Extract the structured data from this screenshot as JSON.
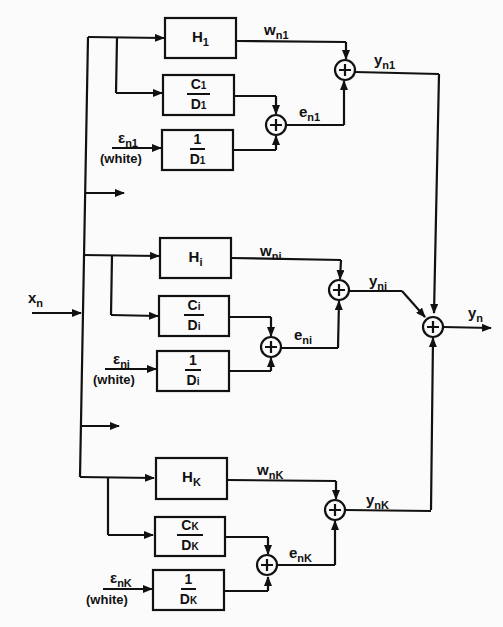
{
  "figure": {
    "type": "block-diagram",
    "input": {
      "symbol": "x",
      "subscript": "n"
    },
    "output": {
      "symbol": "y",
      "subscript": "n"
    },
    "colors": {
      "ink": "#111111",
      "background": "#fbfbfb"
    },
    "branches": [
      {
        "id": "1",
        "H": {
          "symbol": "H",
          "subscript": "1"
        },
        "CD": {
          "num": "C",
          "num_sub": "1",
          "den": "D",
          "den_sub": "1"
        },
        "invD": {
          "num": "1",
          "den": "D",
          "den_sub": "1"
        },
        "noise": {
          "symbol": "ε",
          "subscript": "n1",
          "note": "(white)"
        },
        "w": {
          "symbol": "w",
          "subscript": "n1"
        },
        "e": {
          "symbol": "e",
          "subscript": "n1"
        },
        "y": {
          "symbol": "y",
          "subscript": "n1"
        }
      },
      {
        "id": "i",
        "H": {
          "symbol": "H",
          "subscript": "i"
        },
        "CD": {
          "num": "C",
          "num_sub": "i",
          "den": "D",
          "den_sub": "i"
        },
        "invD": {
          "num": "1",
          "den": "D",
          "den_sub": "i"
        },
        "noise": {
          "symbol": "ε",
          "subscript": "ni",
          "note": "(white)"
        },
        "w": {
          "symbol": "w",
          "subscript": "ni"
        },
        "e": {
          "symbol": "e",
          "subscript": "ni"
        },
        "y": {
          "symbol": "y",
          "subscript": "ni"
        }
      },
      {
        "id": "K",
        "H": {
          "symbol": "H",
          "subscript": "K"
        },
        "CD": {
          "num": "C",
          "num_sub": "K",
          "den": "D",
          "den_sub": "K"
        },
        "invD": {
          "num": "1",
          "den": "D",
          "den_sub": "K"
        },
        "noise": {
          "symbol": "ε",
          "subscript": "nK",
          "note": "(white)"
        },
        "w": {
          "symbol": "w",
          "subscript": "nK"
        },
        "e": {
          "symbol": "e",
          "subscript": "nK"
        },
        "y": {
          "symbol": "y",
          "subscript": "nK"
        }
      }
    ],
    "summer_glyph": "+"
  }
}
